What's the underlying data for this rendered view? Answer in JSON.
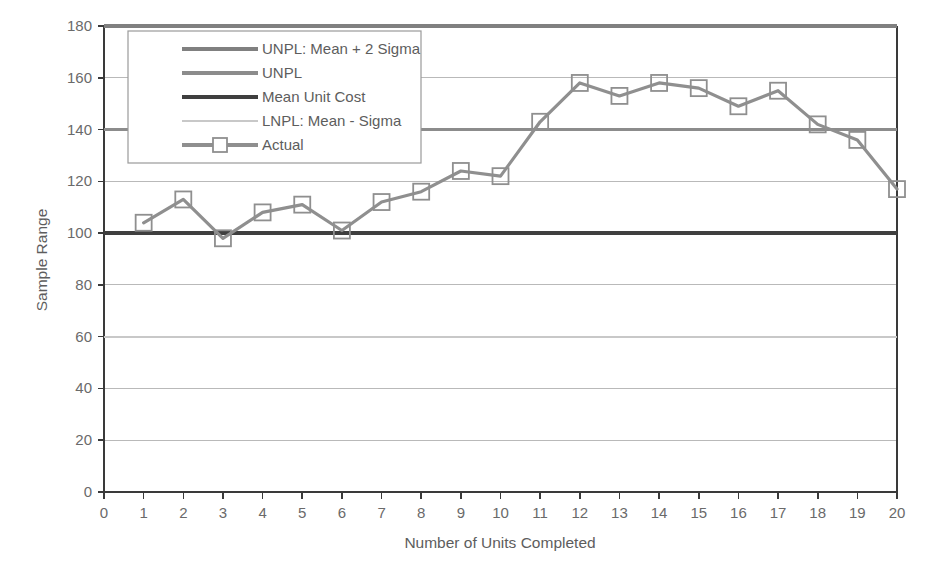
{
  "chart_data": {
    "type": "line",
    "title": "",
    "xlabel": "Number of Units Completed",
    "ylabel": "Sample Range",
    "xlim": [
      0,
      20
    ],
    "ylim": [
      0,
      180
    ],
    "xticks": [
      "0",
      "1",
      "2",
      "3",
      "4",
      "5",
      "6",
      "7",
      "8",
      "9",
      "10",
      "11",
      "12",
      "13",
      "14",
      "15",
      "16",
      "17",
      "18",
      "19",
      "20"
    ],
    "yticks": [
      "0",
      "20",
      "40",
      "60",
      "80",
      "100",
      "120",
      "140",
      "160",
      "180"
    ],
    "grid": "horizontal",
    "legend_position": "top-left-inside",
    "x": [
      1,
      2,
      3,
      4,
      5,
      6,
      7,
      8,
      9,
      10,
      11,
      12,
      13,
      14,
      15,
      16,
      17,
      18,
      19,
      20
    ],
    "series": [
      {
        "name": "UNPL: Mean + 2 Sigma",
        "type": "constant-line",
        "value": 180,
        "color": "#808080",
        "width": 3.2,
        "marker": "none"
      },
      {
        "name": "UNPL",
        "type": "constant-line",
        "value": 140,
        "color": "#8c8c8c",
        "width": 3.2,
        "marker": "none"
      },
      {
        "name": "Mean Unit Cost",
        "type": "constant-line",
        "value": 100,
        "color": "#3f3f3f",
        "width": 4.0,
        "marker": "none"
      },
      {
        "name": "LNPL: Mean - Sigma",
        "type": "constant-line",
        "value": 60,
        "color": "#c8c8c8",
        "width": 2.2,
        "marker": "none"
      },
      {
        "name": "Actual",
        "type": "line-marker",
        "color": "#8f8f8f",
        "width": 3.2,
        "marker": "square",
        "values": [
          104,
          113,
          98,
          108,
          111,
          101,
          112,
          116,
          124,
          122,
          143,
          158,
          153,
          158,
          156,
          149,
          155,
          142,
          136,
          117
        ]
      }
    ]
  },
  "legend": {
    "items": [
      {
        "label": "UNPL: Mean + 2 Sigma",
        "color": "#808080",
        "width": 3.2,
        "marker": "none"
      },
      {
        "label": "UNPL",
        "color": "#8c8c8c",
        "width": 3.2,
        "marker": "none"
      },
      {
        "label": "Mean Unit Cost",
        "color": "#3f3f3f",
        "width": 4.2,
        "marker": "none"
      },
      {
        "label": "LNPL: Mean - Sigma",
        "color": "#c8c8c8",
        "width": 2.2,
        "marker": "none"
      },
      {
        "label": "Actual",
        "color": "#8f8f8f",
        "width": 3.2,
        "marker": "square"
      }
    ]
  },
  "colors": {
    "axis": "#3a3a3a",
    "grid": "#b9b9b9",
    "text": "#5d5d5d",
    "plot_background": "#ffffff",
    "legend_border": "#9a9a9a"
  }
}
